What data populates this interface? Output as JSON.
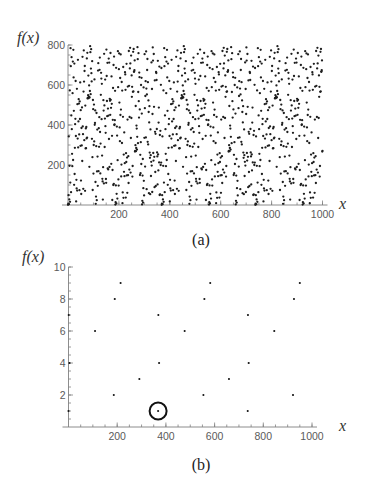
{
  "chart_data": [
    {
      "id": "a",
      "type": "scatter",
      "caption": "(a)",
      "title": "",
      "function": "f(x) = 7^x mod 799",
      "xlabel": "x",
      "ylabel": "f(x)",
      "xlim": [
        0,
        1000
      ],
      "ylim": [
        0,
        800
      ],
      "xticks": [
        200,
        400,
        600,
        800,
        1000
      ],
      "yticks": [
        200,
        400,
        600,
        800
      ],
      "minor_xtick_step": 50,
      "minor_ytick_step": 50,
      "grid": false,
      "legend": null,
      "period": 368,
      "x_start": 0,
      "x_step": 1,
      "y": [
        1,
        7,
        49,
        343,
        4,
        28,
        196,
        573,
        16,
        112,
        784,
        694,
        64,
        448,
        739,
        379,
        256,
        194,
        559,
        717,
        225,
        776,
        638,
        471,
        101,
        707,
        155,
        286,
        404,
        431,
        620,
        345,
        18,
        126,
        83,
        581,
        72,
        504,
        332,
        726,
        288,
        418,
        529,
        507,
        353,
        74,
        518,
        430,
        613,
        296,
        474,
        122,
        55,
        385,
        298,
        488,
        220,
        741,
        393,
        354,
        81,
        567,
        773,
        617,
        324,
        670,
        695,
        71,
        497,
        283,
        383,
        284,
        390,
        333,
        733,
        337,
        761,
        533,
        535,
        549,
        647,
        534,
        542,
        598,
        191,
        538,
        570,
        794,
        764,
        554,
        682,
        779,
        659,
        618,
        331,
        719,
        239,
        75,
        525,
        479,
        157,
        300,
        502,
        318,
        628,
        401,
        410,
        473,
        115,
        6,
        42,
        294,
        460,
        24,
        168,
        377,
        242,
        96,
        672,
        709,
        169,
        384,
        291,
        439,
        676,
        737,
        365,
        158,
        307,
        551,
        661,
        632,
        429,
        606,
        247,
        131,
        118,
        27,
        189,
        524,
        472,
        108,
        756,
        498,
        290,
        432,
        627,
        394,
        361,
        130,
        111,
        777,
        645,
        520,
        444,
        711,
        183,
        482,
        178,
        447,
        732,
        330,
        712,
        190,
        531,
        521,
        451,
        760,
        526,
        486,
        206,
        643,
        506,
        346,
        25,
        175,
        426,
        585,
        100,
        700,
        106,
        742,
        400,
        403,
        424,
        571,
        2,
        14,
        98,
        686,
        8,
        56,
        392,
        347,
        32,
        224,
        769,
        589,
        128,
        97,
        679,
        758,
        512,
        388,
        319,
        635,
        450,
        753,
        477,
        143,
        202,
        615,
        310,
        572,
        9,
        63,
        441,
        690,
        36,
        252,
        166,
        363,
        144,
        209,
        664,
        653,
        576,
        37,
        259,
        215,
        706,
        148,
        237,
        61,
        427,
        592,
        149,
        244,
        110,
        770,
        596,
        177,
        440,
        683,
        786,
        708,
        162,
        335,
        747,
        435,
        648,
        541,
        591,
        142,
        195,
        566,
        766,
        568,
        780,
        666,
        667,
        674,
        723,
        267,
        271,
        299,
        495,
        269,
        285,
        397,
        382,
        277,
        341,
        789,
        729,
        309,
        565,
        759,
        519,
        437,
        662,
        639,
        478,
        150,
        251,
        159,
        314,
        600,
        205,
        636,
        457,
        3,
        21,
        147,
        230,
        12,
        84,
        588,
        121,
        48,
        336,
        754,
        484,
        192,
        545,
        619,
        338,
        768,
        582,
        79,
        553,
        675,
        730,
        316,
        614,
        303,
        523,
        465,
        59,
        413,
        494,
        262,
        236,
        54,
        378,
        249,
        145,
        216,
        713,
        197,
        580,
        65,
        455,
        788,
        722,
        260,
        222,
        755,
        491,
        241,
        89,
        623,
        366,
        165,
        356,
        95,
        665,
        660,
        625,
        380,
        263,
        243,
        103,
        721,
        253,
        173,
        412,
        487,
        213,
        692,
        50,
        350,
        53,
        371,
        200,
        601,
        212,
        685,
        1,
        7,
        49,
        343,
        4,
        28,
        196,
        573,
        16,
        112,
        784,
        694,
        64,
        448,
        739,
        379,
        256,
        194,
        559,
        717,
        225,
        776,
        638,
        471,
        101,
        707,
        155,
        286,
        404,
        431,
        620,
        345,
        18,
        126,
        83,
        581,
        72,
        504,
        332,
        726,
        288,
        418,
        529,
        507,
        353,
        74,
        518,
        430,
        613,
        296,
        474,
        122,
        55,
        385,
        298,
        488,
        220,
        741,
        393,
        354,
        81,
        567,
        773,
        617,
        324,
        670,
        695,
        71,
        497,
        283,
        383,
        284,
        390,
        333,
        733,
        337,
        761,
        533,
        535,
        549,
        647,
        534,
        542,
        598,
        191,
        538,
        570,
        794,
        764,
        554,
        682,
        779,
        659,
        618,
        331,
        719,
        239,
        75,
        525,
        479,
        157,
        300,
        502,
        318,
        628,
        401,
        410,
        473,
        115,
        6,
        42,
        294,
        460,
        24,
        168,
        377,
        242,
        96,
        672,
        709,
        169,
        384,
        291,
        439,
        676,
        737,
        365,
        158,
        307,
        551,
        661,
        632,
        429,
        606,
        247,
        131,
        118,
        27,
        189,
        524,
        472,
        108,
        756,
        498,
        290,
        432,
        627,
        394,
        361,
        130,
        111,
        777,
        645,
        520,
        444,
        711,
        183,
        482,
        178,
        447,
        732,
        330,
        712,
        190,
        531,
        521,
        451,
        760,
        526,
        486,
        206,
        643,
        506,
        346,
        25,
        175,
        426,
        585,
        100,
        700,
        106,
        742,
        400,
        403,
        424,
        571,
        2,
        14,
        98,
        686,
        8,
        56,
        392,
        347,
        32,
        224,
        769,
        589,
        128,
        97,
        679,
        758,
        512,
        388,
        319,
        635,
        450,
        753,
        477,
        143,
        202,
        615,
        310,
        572,
        9,
        63,
        441,
        690,
        36,
        252,
        166,
        363,
        144,
        209,
        664,
        653,
        576,
        37,
        259,
        215,
        706,
        148,
        237,
        61,
        427,
        592,
        149,
        244,
        110,
        770,
        596,
        177,
        440,
        683,
        786,
        708,
        162,
        335,
        747,
        435,
        648,
        541,
        591,
        142,
        195,
        566,
        766,
        568,
        780,
        666,
        667,
        674,
        723,
        267,
        271,
        299,
        495,
        269,
        285,
        397,
        382,
        277,
        341,
        789,
        729,
        309,
        565,
        759,
        519,
        437,
        662,
        639,
        478,
        150,
        251,
        159,
        314,
        600,
        205,
        636,
        457,
        3,
        21,
        147,
        230,
        12,
        84,
        588,
        121,
        48,
        336,
        754,
        484,
        192,
        545,
        619,
        338,
        768,
        582,
        79,
        553,
        675,
        730,
        316,
        614,
        303,
        523,
        465,
        59,
        413,
        494,
        262,
        236,
        54,
        378,
        249,
        145,
        216,
        713,
        197,
        580,
        65,
        455,
        788,
        722,
        260,
        222,
        755,
        491,
        241,
        89,
        623,
        366,
        165,
        356,
        95,
        665,
        660,
        625,
        380,
        263,
        243,
        103,
        721,
        253,
        173,
        412,
        487,
        213,
        692,
        50,
        350,
        53,
        371,
        200,
        601,
        212,
        685,
        1,
        7,
        49,
        343,
        4,
        28,
        196,
        573,
        16,
        112,
        784,
        694,
        64,
        448,
        739,
        379,
        256,
        194,
        559,
        717,
        225,
        776,
        638,
        471,
        101,
        707,
        155,
        286,
        404,
        431,
        620,
        345,
        18,
        126,
        83,
        581,
        72,
        504,
        332,
        726,
        288,
        418,
        529,
        507,
        353,
        74,
        518,
        430,
        613,
        296,
        474,
        122,
        55,
        385,
        298,
        488,
        220,
        741,
        393,
        354,
        81,
        567,
        773,
        617,
        324,
        670,
        695,
        71,
        497,
        283,
        383,
        284,
        390,
        333,
        733,
        337,
        761,
        533,
        535,
        549,
        647,
        534,
        542,
        598,
        191,
        538,
        570,
        794,
        764,
        554,
        682,
        779,
        659,
        618,
        331,
        719,
        239,
        75,
        525,
        479,
        157,
        300,
        502,
        318,
        628,
        401,
        410,
        473,
        115,
        6,
        42,
        294,
        460,
        24,
        168,
        377,
        242,
        96,
        672,
        709,
        169,
        384,
        291,
        439,
        676,
        737,
        365,
        158,
        307,
        551,
        661,
        632,
        429,
        606,
        247,
        131,
        118,
        27,
        189,
        524,
        472,
        108,
        756,
        498,
        290,
        432,
        627,
        394,
        361,
        130,
        111,
        777,
        645,
        520,
        444,
        711,
        183,
        482,
        178,
        447,
        732,
        330,
        712,
        190,
        531,
        521,
        451,
        760,
        526,
        486,
        206,
        643,
        506,
        346,
        25,
        175,
        426,
        585,
        100,
        700,
        106,
        742,
        400,
        403,
        424,
        571,
        2,
        14,
        98,
        686,
        8,
        56,
        392,
        347,
        32,
        224,
        769,
        589,
        128,
        97,
        679,
        758,
        512,
        388,
        319,
        635,
        450,
        753,
        477,
        143,
        202,
        615,
        310,
        572,
        9,
        63,
        441,
        690,
        36,
        252,
        166,
        363,
        144,
        209,
        664,
        653,
        576,
        37,
        259,
        215,
        706,
        148,
        237,
        61,
        427,
        592,
        149,
        244,
        110,
        770,
        596,
        177,
        440,
        683,
        786,
        708,
        162,
        335,
        747,
        435,
        648,
        541,
        591,
        142,
        195,
        566,
        766,
        568,
        780,
        666,
        667,
        674,
        723,
        267,
        271
      ]
    },
    {
      "id": "b",
      "type": "scatter",
      "caption": "(b)",
      "title": "",
      "description": "points of f(x) = 7^x mod 799 with f(x) <= 10",
      "xlabel": "x",
      "ylabel": "f(x)",
      "xlim": [
        0,
        1000
      ],
      "ylim": [
        0,
        10
      ],
      "xticks": [
        200,
        400,
        600,
        800,
        1000
      ],
      "yticks": [
        2,
        4,
        6,
        8,
        10
      ],
      "minor_xtick_step": 50,
      "minor_ytick_step": 0.5,
      "grid": false,
      "legend": null,
      "points": [
        [
          0,
          1
        ],
        [
          1,
          7
        ],
        [
          4,
          4
        ],
        [
          109,
          6
        ],
        [
          186,
          2
        ],
        [
          190,
          8
        ],
        [
          214,
          9
        ],
        [
          291,
          3
        ],
        [
          368,
          1
        ],
        [
          369,
          7
        ],
        [
          372,
          4
        ],
        [
          477,
          6
        ],
        [
          554,
          2
        ],
        [
          558,
          8
        ],
        [
          582,
          9
        ],
        [
          659,
          3
        ],
        [
          736,
          1
        ],
        [
          737,
          7
        ],
        [
          740,
          4
        ],
        [
          845,
          6
        ],
        [
          922,
          2
        ],
        [
          926,
          8
        ],
        [
          950,
          9
        ]
      ],
      "annotations": [
        {
          "shape": "circle",
          "x": 368,
          "y": 1
        }
      ]
    }
  ]
}
